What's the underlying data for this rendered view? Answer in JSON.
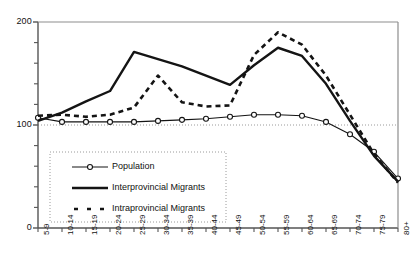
{
  "chart_data": {
    "type": "line",
    "title": "",
    "subtitle": "",
    "xlabel": "",
    "ylabel": "",
    "xlim_categories": [
      "5-9",
      "10-14",
      "15-19",
      "20-24",
      "25-29",
      "30-34",
      "35-39",
      "40-44",
      "45-49",
      "50-54",
      "55-59",
      "60-64",
      "65-69",
      "70-74",
      "75-79",
      "80+"
    ],
    "ylim": [
      0,
      200
    ],
    "yticks": [
      0,
      100,
      200
    ],
    "ytick_labels": [
      "0",
      "100",
      "200"
    ],
    "y_minor_ticks": true,
    "grid": "horizontal-dotted-at-100",
    "legend_position": "inside-lower-left",
    "categories": [
      "5-9",
      "10-14",
      "15-19",
      "20-24",
      "25-29",
      "30-34",
      "35-39",
      "40-44",
      "45-49",
      "50-54",
      "55-59",
      "60-64",
      "65-69",
      "70-74",
      "75-79",
      "80+"
    ],
    "series": [
      {
        "name": "Population",
        "style": "solid-thin-open-circle-markers",
        "values": [
          107,
          103,
          103,
          103,
          103,
          104,
          105,
          106,
          108,
          110,
          110,
          109,
          103,
          91,
          74,
          48
        ]
      },
      {
        "name": "Interprovincial Migrants",
        "style": "solid-thick",
        "values": [
          104,
          112,
          123,
          133,
          171,
          164,
          157,
          148,
          139,
          158,
          175,
          167,
          140,
          104,
          70,
          45
        ]
      },
      {
        "name": "Intraprovincial Migrants",
        "style": "dashed-thick",
        "values": [
          109,
          110,
          108,
          110,
          117,
          148,
          122,
          118,
          119,
          168,
          190,
          178,
          148,
          110,
          72,
          44
        ]
      }
    ],
    "colors": {
      "population": "#1a1a1a",
      "interprovincial": "#111111",
      "intraprovincial": "#111111",
      "axis": "#555555",
      "gridline": "#9a9a9a",
      "plot_background": "#ffffff"
    }
  },
  "legend": {
    "items": [
      {
        "label": "Population",
        "key": "population"
      },
      {
        "label": "Interprovincial Migrants",
        "key": "interprovincial"
      },
      {
        "label": "Intraprovincial Migrants",
        "key": "intraprovincial"
      }
    ]
  },
  "axes": {
    "y_labels": [
      "200",
      "100",
      "0"
    ],
    "x_labels": [
      "5-9",
      "10-14",
      "15-19",
      "20-24",
      "25-29",
      "30-34",
      "35-39",
      "40-44",
      "45-49",
      "50-54",
      "55-59",
      "60-64",
      "65-69",
      "70-74",
      "75-79",
      "80+"
    ]
  }
}
